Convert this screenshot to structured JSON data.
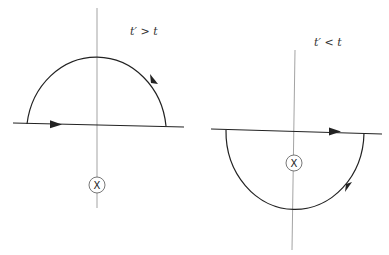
{
  "diagram": {
    "title": "",
    "colors": {
      "contour": "#222222",
      "axis": "#999999",
      "pole": "#555555",
      "background": "#ffffff"
    },
    "panels": [
      {
        "id": "left",
        "label": "t′ > t",
        "closure": "upper-half-plane",
        "direction": "counter-clockwise",
        "pole_symbol": "X",
        "pole_location": "below-real-axis",
        "pole_enclosed": false
      },
      {
        "id": "right",
        "label": "t′ < t",
        "closure": "lower-half-plane",
        "direction": "clockwise",
        "pole_symbol": "X",
        "pole_location": "below-real-axis",
        "pole_enclosed": true
      }
    ]
  }
}
